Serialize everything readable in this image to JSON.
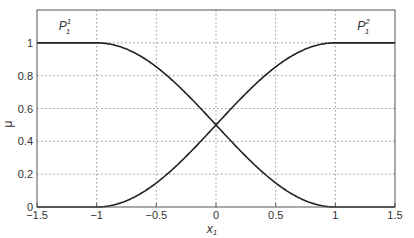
{
  "chart_data": {
    "type": "line",
    "title": "",
    "xlabel": "x",
    "xlabel_sub": "1",
    "ylabel": "μ",
    "xlim": [
      -1.5,
      1.5
    ],
    "ylim": [
      0,
      1.2
    ],
    "grid": true,
    "xticks": [
      "-1.5",
      "-1",
      "-0.5",
      "0",
      "0.5",
      "1",
      "1.5"
    ],
    "yticks": [
      "0",
      "0.2",
      "0.4",
      "0.6",
      "0.8",
      "1"
    ],
    "series": [
      {
        "name": "P_1^1",
        "x": [
          -1.5,
          -1.0,
          -0.75,
          -0.5,
          -0.25,
          0,
          0.25,
          0.5,
          0.75,
          1.0,
          1.5
        ],
        "values": [
          1.0,
          1.0,
          0.96,
          0.85,
          0.69,
          0.5,
          0.31,
          0.15,
          0.04,
          0.0,
          0.0
        ]
      },
      {
        "name": "P_1^2",
        "x": [
          -1.5,
          -1.0,
          -0.75,
          -0.5,
          -0.25,
          0,
          0.25,
          0.5,
          0.75,
          1.0,
          1.5
        ],
        "values": [
          0.0,
          0.0,
          0.04,
          0.15,
          0.31,
          0.5,
          0.69,
          0.85,
          0.96,
          1.0,
          1.0
        ]
      }
    ],
    "annotations": [
      {
        "text": "P",
        "sup": "1",
        "sub": "1",
        "x": -1.25,
        "y": 1.1
      },
      {
        "text": "P",
        "sup": "2",
        "sub": "1",
        "x": 1.25,
        "y": 1.1
      }
    ]
  }
}
